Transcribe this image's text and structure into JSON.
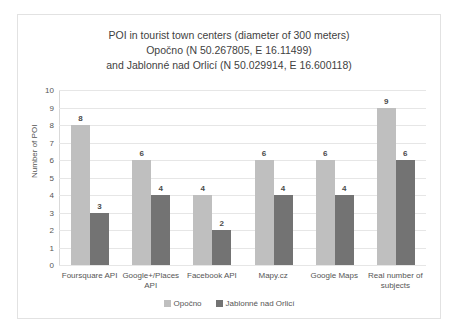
{
  "chart_data": {
    "type": "bar",
    "title": "POI in tourist town centers (diameter of 300 meters)\nOpočno (N 50.267805, E 16.11499)\nand Jablonné nad Orlicí (N 50.029914, E 16.600118)",
    "title_lines": [
      "POI in tourist town centers (diameter of 300 meters)",
      "Opočno (N 50.267805, E 16.11499)",
      "and Jablonné nad Orlicí (N 50.029914, E 16.600118)"
    ],
    "categories": [
      "Foursquare API",
      "Google+/Places API",
      "Facebook API",
      "Mapy.cz",
      "Google Maps",
      "Real number of subjects"
    ],
    "series": [
      {
        "name": "Opočno",
        "values": [
          8,
          6,
          4,
          6,
          6,
          9
        ],
        "color": "#bfbfbf"
      },
      {
        "name": "Jablonné nad Orlicí",
        "values": [
          3,
          4,
          2,
          4,
          4,
          6
        ],
        "color": "#737373"
      }
    ],
    "xlabel": "",
    "ylabel": "Number of POI",
    "ylim": [
      0,
      10
    ],
    "yticks": [
      0,
      1,
      2,
      3,
      4,
      5,
      6,
      7,
      8,
      9,
      10
    ],
    "grid": true,
    "legend_position": "bottom",
    "data_labels": true
  }
}
